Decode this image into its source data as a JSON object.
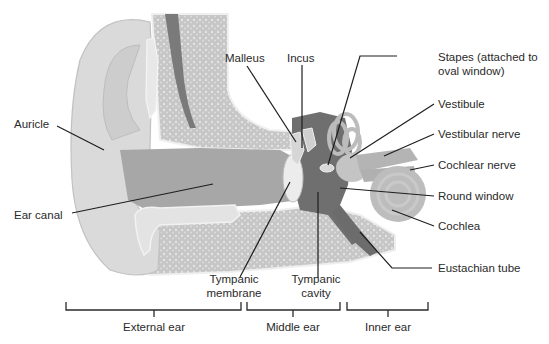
{
  "diagram": {
    "colors": {
      "skin_light": "#dcdcdc",
      "skin_mid": "#cfcfcf",
      "canal": "#a9a9a9",
      "bone": "#c9c9c9",
      "bone_dots": "#e6e6e6",
      "dark_vessel": "#7c7c7c",
      "cavity": "#6e6e6e",
      "membrane": "#ececec",
      "leader": "#1e1e1e",
      "text": "#2a2a2a"
    },
    "labels": {
      "malleus": "Malleus",
      "incus": "Incus",
      "stapes_line1": "Stapes (attached to",
      "stapes_line2": "oval window)",
      "vestibule": "Vestibule",
      "vestibular_nerve": "Vestibular nerve",
      "cochlear_nerve": "Cochlear nerve",
      "round_window": "Round window",
      "cochlea": "Cochlea",
      "eustachian_tube": "Eustachian tube",
      "auricle": "Auricle",
      "ear_canal": "Ear canal",
      "tympanic_membrane_line1": "Tympanic",
      "tympanic_membrane_line2": "membrane",
      "tympanic_cavity_line1": "Tympanic",
      "tympanic_cavity_line2": "cavity"
    },
    "regions": [
      {
        "label": "External ear",
        "x_start": 62,
        "x_end": 241
      },
      {
        "label": "Middle ear",
        "x_start": 247,
        "x_end": 340
      },
      {
        "label": "Inner ear",
        "x_start": 347,
        "x_end": 428
      }
    ]
  }
}
